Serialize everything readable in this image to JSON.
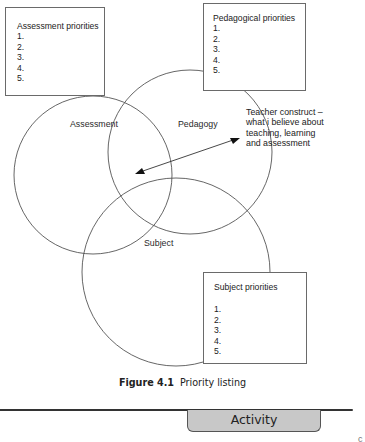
{
  "boxes": {
    "assessment": {
      "title": "Assessment priorities",
      "items": [
        "1.",
        "2.",
        "3.",
        "4.",
        "5."
      ]
    },
    "pedagogical": {
      "title": "Pedagogical priorities",
      "items": [
        "1.",
        "2.",
        "3.",
        "4.",
        "5."
      ]
    },
    "subject": {
      "title": "Subject priorities",
      "items": [
        "1.",
        "2.",
        "3.",
        "4.",
        "5."
      ]
    }
  },
  "circles": {
    "assessment": "Assessment",
    "pedagogy": "Pedagogy",
    "subject": "Subject"
  },
  "construct": {
    "line1": "Teacher construct –",
    "line2": "what i believe about",
    "line3": "teaching, learning",
    "line4": "and assessment"
  },
  "caption": {
    "label": "Figure 4.1",
    "text": "Priority listing"
  },
  "activity": {
    "label": "Activity"
  },
  "colors": {
    "stroke": "#555555",
    "tab_fill": "#c8c8c8"
  }
}
